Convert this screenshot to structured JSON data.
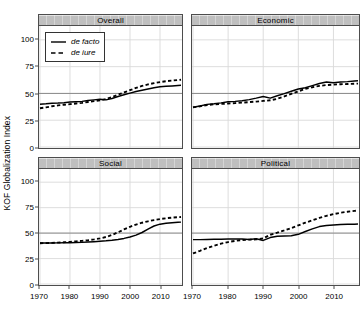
{
  "chart_data": {
    "type": "line",
    "title": "",
    "xlabel": "",
    "ylabel": "KOF Globalization Index",
    "xlim": [
      1970,
      2017
    ],
    "ylim": [
      0,
      112
    ],
    "yticks": [
      0,
      25,
      50,
      75,
      100
    ],
    "xticks": [
      1970,
      1980,
      1990,
      2000,
      2010
    ],
    "grid": true,
    "legend_position": "top-left inside Overall panel",
    "reference_line": 50,
    "panels": [
      {
        "id": "overall",
        "title": "Overall",
        "position": "top-left",
        "series": [
          {
            "name": "de facto",
            "style": "solid",
            "x": [
              1970,
              1972,
              1974,
              1976,
              1978,
              1980,
              1982,
              1984,
              1986,
              1988,
              1990,
              1992,
              1994,
              1996,
              1998,
              2000,
              2002,
              2004,
              2006,
              2008,
              2010,
              2012,
              2014,
              2016,
              2017
            ],
            "values": [
              40.0,
              40.3,
              40.8,
              41.0,
              41.4,
              42.0,
              42.3,
              42.6,
              43.3,
              44.0,
              44.6,
              44.0,
              45.3,
              47.2,
              48.7,
              50.3,
              51.8,
              53.0,
              54.2,
              55.3,
              56.2,
              56.6,
              57.0,
              57.4,
              57.6
            ]
          },
          {
            "name": "de iure",
            "style": "dashed",
            "x": [
              1970,
              1972,
              1974,
              1976,
              1978,
              1980,
              1982,
              1984,
              1986,
              1988,
              1990,
              1992,
              1994,
              1996,
              1998,
              2000,
              2002,
              2004,
              2006,
              2008,
              2010,
              2012,
              2014,
              2016,
              2017
            ],
            "values": [
              36.2,
              37.0,
              38.0,
              38.8,
              39.4,
              40.0,
              40.6,
              41.2,
              42.0,
              42.8,
              43.6,
              44.8,
              46.6,
              48.8,
              50.9,
              53.0,
              55.2,
              57.0,
              58.4,
              59.6,
              60.6,
              61.4,
              62.0,
              62.5,
              62.8
            ]
          }
        ]
      },
      {
        "id": "economic",
        "title": "Economic",
        "position": "top-right",
        "series": [
          {
            "name": "de facto",
            "style": "solid",
            "x": [
              1970,
              1972,
              1974,
              1976,
              1978,
              1980,
              1982,
              1984,
              1986,
              1988,
              1990,
              1992,
              1994,
              1996,
              1998,
              2000,
              2002,
              2004,
              2006,
              2008,
              2010,
              2012,
              2014,
              2016,
              2017
            ],
            "values": [
              37.2,
              38.2,
              39.8,
              40.4,
              41.2,
              42.2,
              42.6,
              43.2,
              44.2,
              45.6,
              47.2,
              45.6,
              47.8,
              49.8,
              52.0,
              54.2,
              55.3,
              57.3,
              59.3,
              60.6,
              60.0,
              60.6,
              61.0,
              61.6,
              61.8
            ]
          },
          {
            "name": "de iure",
            "style": "dashed",
            "x": [
              1970,
              1972,
              1974,
              1976,
              1978,
              1980,
              1982,
              1984,
              1986,
              1988,
              1990,
              1992,
              1994,
              1996,
              1998,
              2000,
              2002,
              2004,
              2006,
              2008,
              2010,
              2012,
              2014,
              2016,
              2017
            ],
            "values": [
              37.0,
              38.0,
              39.2,
              39.8,
              40.2,
              40.6,
              41.0,
              41.4,
              41.9,
              42.4,
              43.0,
              43.6,
              45.0,
              47.2,
              49.6,
              52.0,
              54.2,
              55.8,
              57.0,
              57.8,
              58.2,
              58.6,
              58.8,
              59.0,
              59.2
            ]
          }
        ]
      },
      {
        "id": "social",
        "title": "Social",
        "position": "bottom-left",
        "series": [
          {
            "name": "de facto",
            "style": "solid",
            "x": [
              1970,
              1972,
              1974,
              1976,
              1978,
              1980,
              1982,
              1984,
              1986,
              1988,
              1990,
              1992,
              1994,
              1996,
              1998,
              2000,
              2002,
              2004,
              2006,
              2008,
              2010,
              2012,
              2014,
              2016,
              2017
            ],
            "values": [
              40.2,
              40.2,
              40.3,
              40.4,
              40.5,
              40.6,
              40.7,
              40.9,
              41.2,
              41.6,
              42.0,
              42.4,
              43.0,
              43.8,
              44.8,
              46.2,
              48.0,
              50.6,
              54.0,
              57.0,
              58.8,
              59.6,
              60.2,
              60.6,
              60.8
            ]
          },
          {
            "name": "de iure",
            "style": "dashed",
            "x": [
              1970,
              1972,
              1974,
              1976,
              1978,
              1980,
              1982,
              1984,
              1986,
              1988,
              1990,
              1992,
              1994,
              1996,
              1998,
              2000,
              2002,
              2004,
              2006,
              2008,
              2010,
              2012,
              2014,
              2016,
              2017
            ],
            "values": [
              40.0,
              40.2,
              40.4,
              40.7,
              41.0,
              41.4,
              41.9,
              42.4,
              43.0,
              43.8,
              44.8,
              46.2,
              48.2,
              50.8,
              53.6,
              56.2,
              58.4,
              60.2,
              61.6,
              62.8,
              63.8,
              64.6,
              65.2,
              65.6,
              65.8
            ]
          }
        ]
      },
      {
        "id": "political",
        "title": "Political",
        "position": "bottom-right",
        "series": [
          {
            "name": "de facto",
            "style": "solid",
            "x": [
              1970,
              1972,
              1974,
              1976,
              1978,
              1980,
              1982,
              1984,
              1986,
              1988,
              1990,
              1992,
              1994,
              1996,
              1998,
              2000,
              2002,
              2004,
              2006,
              2008,
              2010,
              2012,
              2014,
              2016,
              2017
            ],
            "values": [
              43.6,
              43.6,
              43.8,
              43.9,
              44.0,
              44.2,
              44.3,
              44.2,
              43.8,
              44.4,
              42.8,
              45.6,
              47.0,
              47.2,
              47.4,
              48.8,
              51.6,
              54.2,
              56.4,
              57.4,
              58.0,
              58.4,
              58.6,
              58.8,
              59.0
            ]
          },
          {
            "name": "de iure",
            "style": "dashed",
            "x": [
              1970,
              1972,
              1974,
              1976,
              1978,
              1980,
              1982,
              1984,
              1986,
              1988,
              1990,
              1992,
              1994,
              1996,
              1998,
              2000,
              2002,
              2004,
              2006,
              2008,
              2010,
              2012,
              2014,
              2016,
              2017
            ],
            "values": [
              30.0,
              32.6,
              35.4,
              37.6,
              39.6,
              41.2,
              42.4,
              43.2,
              43.6,
              43.8,
              44.8,
              48.4,
              50.4,
              52.6,
              55.0,
              57.6,
              60.2,
              62.6,
              65.0,
              67.0,
              68.6,
              70.0,
              71.0,
              71.8,
              72.2
            ]
          }
        ]
      }
    ],
    "legend": [
      {
        "label": "de facto",
        "style": "solid"
      },
      {
        "label": "de iure",
        "style": "dashed"
      }
    ],
    "colors": {
      "line": "#000000",
      "grid": "#d9d9d9",
      "reference_line": "#808080",
      "strip_background": "#bfbfbf",
      "strip_border": "#4d4d4d",
      "panel_border": "#4d4d4d",
      "background": "#ffffff"
    }
  }
}
